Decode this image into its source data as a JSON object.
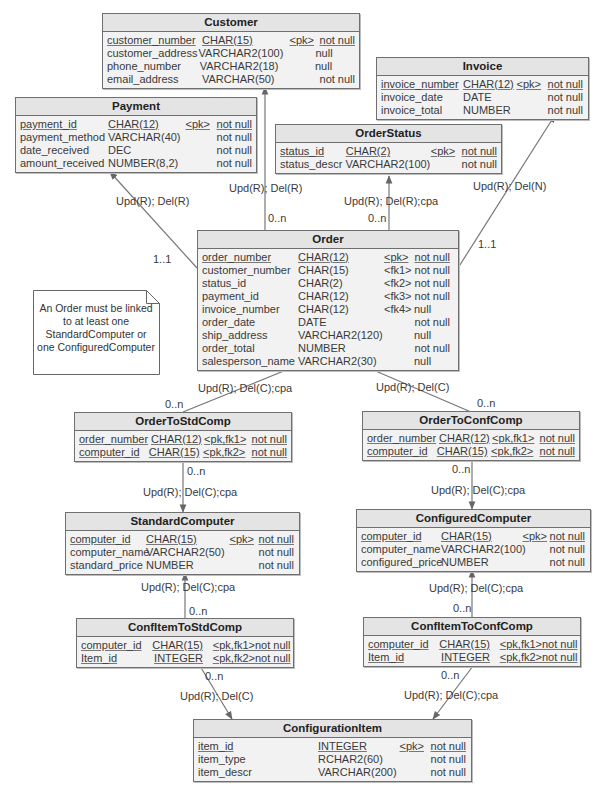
{
  "entities": {
    "customer": {
      "title": "Customer",
      "rows": [
        {
          "name": "customer_number",
          "type": "CHAR(15)",
          "key": "<pk>",
          "nullity": "not null"
        },
        {
          "name": "customer_address",
          "type": "VARCHAR2(100)",
          "key": "",
          "nullity": "null"
        },
        {
          "name": "phone_number",
          "type": "VARCHAR2(18)",
          "key": "",
          "nullity": "null"
        },
        {
          "name": "email_address",
          "type": "VARCHAR(50)",
          "key": "",
          "nullity": "not null"
        }
      ]
    },
    "payment": {
      "title": "Payment",
      "rows": [
        {
          "name": "payment_id",
          "type": "CHAR(12)",
          "key": "<pk>",
          "nullity": "not null"
        },
        {
          "name": "payment_method",
          "type": "VARCHAR(40)",
          "key": "",
          "nullity": "not null"
        },
        {
          "name": "date_received",
          "type": "DEC",
          "key": "",
          "nullity": "not null"
        },
        {
          "name": "amount_received",
          "type": "NUMBER(8,2)",
          "key": "",
          "nullity": "not null"
        }
      ]
    },
    "invoice": {
      "title": "Invoice",
      "rows": [
        {
          "name": "invoice_number",
          "type": "CHAR(12)",
          "key": "<pk>",
          "nullity": "not null"
        },
        {
          "name": "invoice_date",
          "type": "DATE",
          "key": "",
          "nullity": "not null"
        },
        {
          "name": "invoice_total",
          "type": "NUMBER",
          "key": "",
          "nullity": "not null"
        }
      ]
    },
    "orderstatus": {
      "title": "OrderStatus",
      "rows": [
        {
          "name": "status_id",
          "type": "CHAR(2)",
          "key": "<pk>",
          "nullity": "not null"
        },
        {
          "name": "status_descr",
          "type": "VARCHAR2(100)",
          "key": "",
          "nullity": "not null"
        }
      ]
    },
    "order": {
      "title": "Order",
      "rows": [
        {
          "name": "order_number",
          "type": "CHAR(12)",
          "key": "<pk>",
          "nullity": "not null"
        },
        {
          "name": "customer_number",
          "type": "CHAR(15)",
          "key": "<fk1>",
          "nullity": "not null"
        },
        {
          "name": "status_id",
          "type": "CHAR(2)",
          "key": "<fk2>",
          "nullity": "not null"
        },
        {
          "name": "payment_id",
          "type": "CHAR(12)",
          "key": "<fk3>",
          "nullity": "not null"
        },
        {
          "name": "invoice_number",
          "type": "CHAR(12)",
          "key": "<fk4>",
          "nullity": "null"
        },
        {
          "name": "order_date",
          "type": "DATE",
          "key": "",
          "nullity": "not null"
        },
        {
          "name": "ship_address",
          "type": "VARCHAR2(120)",
          "key": "",
          "nullity": "null"
        },
        {
          "name": "order_total",
          "type": "NUMBER",
          "key": "",
          "nullity": "not null"
        },
        {
          "name": "salesperson_name",
          "type": "VARCHAR2(30)",
          "key": "",
          "nullity": "null"
        }
      ]
    },
    "ordertostdcomp": {
      "title": "OrderToStdComp",
      "rows": [
        {
          "name": "order_number",
          "type": "CHAR(12)",
          "key": "<pk,fk1>",
          "nullity": "not null"
        },
        {
          "name": "computer_id",
          "type": "CHAR(15)",
          "key": "<pk,fk2>",
          "nullity": "not null"
        }
      ]
    },
    "ordertoconfcomp": {
      "title": "OrderToConfComp",
      "rows": [
        {
          "name": "order_number",
          "type": "CHAR(12)",
          "key": "<pk,fk1>",
          "nullity": "not null"
        },
        {
          "name": "computer_id",
          "type": "CHAR(15)",
          "key": "<pk,fk2>",
          "nullity": "not null"
        }
      ]
    },
    "standardcomputer": {
      "title": "StandardComputer",
      "rows": [
        {
          "name": "computer_id",
          "type": "CHAR(15)",
          "key": "<pk>",
          "nullity": "not null"
        },
        {
          "name": "computer_name",
          "type": "VARCHAR2(50)",
          "key": "",
          "nullity": "not null"
        },
        {
          "name": "standard_price",
          "type": "NUMBER",
          "key": "",
          "nullity": "not null"
        }
      ]
    },
    "configuredcomputer": {
      "title": "ConfiguredComputer",
      "rows": [
        {
          "name": "computer_id",
          "type": "CHAR(15)",
          "key": "<pk>",
          "nullity": "not null"
        },
        {
          "name": "computer_name",
          "type": "VARCHAR2(100)",
          "key": "",
          "nullity": "not null"
        },
        {
          "name": "configured_price",
          "type": "NUMBER",
          "key": "",
          "nullity": "not null"
        }
      ]
    },
    "confitemtostdcomp": {
      "title": "ConfItemToStdComp",
      "rows": [
        {
          "name": "computer_id",
          "type": "CHAR(15)",
          "key": "<pk,fk1>",
          "nullity": "not null"
        },
        {
          "name": "Item_id",
          "type": "INTEGER",
          "key": "<pk,fk2>",
          "nullity": "not null"
        }
      ]
    },
    "confitemtoconfcomp": {
      "title": "ConfItemToConfComp",
      "rows": [
        {
          "name": "computer_id",
          "type": "CHAR(15)",
          "key": "<pk,fk1>",
          "nullity": "not null"
        },
        {
          "name": "Item_id",
          "type": "INTEGER",
          "key": "<pk,fk2>",
          "nullity": "not null"
        }
      ]
    },
    "configurationitem": {
      "title": "ConfigurationItem",
      "rows": [
        {
          "name": "item_id",
          "type": "INTEGER",
          "key": "<pk>",
          "nullity": "not null"
        },
        {
          "name": "item_type",
          "type": "RCHAR2(60)",
          "key": "",
          "nullity": "not null"
        },
        {
          "name": "item_descr",
          "type": "VARCHAR(200)",
          "key": "",
          "nullity": "not null"
        }
      ]
    }
  },
  "relationships": [
    {
      "id": "order-customer",
      "rule": "Upd(R); Del(R)",
      "cardinality": "0..n"
    },
    {
      "id": "order-payment",
      "rule": "Upd(R); Del(R)",
      "cardinality": "1..1"
    },
    {
      "id": "order-orderstatus",
      "rule": "Upd(R); Del(R);cpa",
      "cardinality": "0..n"
    },
    {
      "id": "order-invoice",
      "rule": "Upd(R); Del(N)",
      "cardinality": "1..1"
    },
    {
      "id": "ordertostdcomp-order",
      "rule": "Upd(R); Del(C);cpa",
      "cardinality": "0..n"
    },
    {
      "id": "ordertoconfcomp-order",
      "rule": "Upd(R); Del(C)",
      "cardinality": "0..n"
    },
    {
      "id": "ordertostdcomp-standardcomputer",
      "rule": "Upd(R); Del(C);cpa",
      "cardinality": "0..n"
    },
    {
      "id": "ordertoconfcomp-configuredcomputer",
      "rule": "Upd(R); Del(C);cpa",
      "cardinality": "0..n"
    },
    {
      "id": "confitemtostdcomp-standardcomputer",
      "rule": "Upd(R); Del(C);cpa",
      "cardinality": "0..n"
    },
    {
      "id": "confitemtoconfcomp-configuredcomputer",
      "rule": "Upd(R); Del(C);cpa",
      "cardinality": "0..n"
    },
    {
      "id": "confitemtostdcomp-configurationitem",
      "rule": "Upd(R); Del(C)",
      "cardinality": "0..n"
    },
    {
      "id": "confitemtoconfcomp-configurationitem",
      "rule": "Upd(R); Del(C);cpa",
      "cardinality": "0..n"
    }
  ],
  "note": {
    "lines": [
      "An Order must be linked",
      "to at least one",
      "StandardComputer or",
      "one ConfiguredComputer"
    ]
  },
  "colors": {
    "entity_fill": "#f2f2f2",
    "entity_header": "#e4e4e4",
    "border": "#6f6f6f",
    "line": "#777777"
  }
}
